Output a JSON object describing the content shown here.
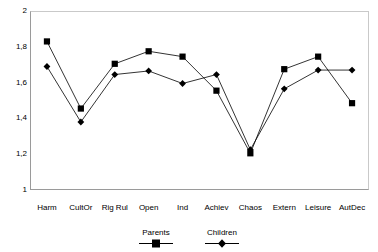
{
  "chart_data": {
    "type": "line",
    "title": "",
    "xlabel": "",
    "ylabel": "",
    "ylim": [
      1,
      2
    ],
    "yticks": [
      "1",
      "1,2",
      "1,4",
      "1,6",
      "1,8",
      "2"
    ],
    "ytick_values": [
      1,
      1.2,
      1.4,
      1.6,
      1.8,
      2
    ],
    "grid": false,
    "legend_position": "bottom-center",
    "categories": [
      "Harm",
      "CultOr",
      "Rig Rul",
      "Open",
      "Ind",
      "Achiev",
      "Chaos",
      "Extern",
      "Leisure",
      "AutDec"
    ],
    "series": [
      {
        "name": "Parents",
        "marker": "square",
        "color": "#000000",
        "values": [
          1.83,
          1.455,
          1.705,
          1.775,
          1.745,
          1.555,
          1.205,
          1.675,
          1.745,
          1.485
        ]
      },
      {
        "name": "Children",
        "marker": "diamond",
        "color": "#000000",
        "values": [
          1.69,
          1.38,
          1.645,
          1.665,
          1.595,
          1.645,
          1.225,
          1.565,
          1.67,
          1.67
        ]
      }
    ]
  },
  "axis": {
    "tick_labels": [
      "2",
      "1,8",
      "1,6",
      "1,4",
      "1,2",
      "1"
    ],
    "category_labels": [
      "Harm",
      "CultOr",
      "Rig Rul",
      "Open",
      "Ind",
      "Achiev",
      "Chaos",
      "Extern",
      "Leisure",
      "AutDec"
    ]
  },
  "legend": {
    "items": [
      {
        "label": "Parents",
        "marker": "square-marker-icon"
      },
      {
        "label": "Children",
        "marker": "diamond-marker-icon"
      }
    ]
  }
}
